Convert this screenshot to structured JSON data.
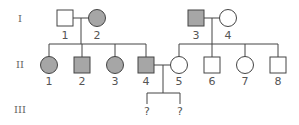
{
  "colors": {
    "affected": "#a6a6a6",
    "unaffected": "#ffffff",
    "stroke": "#444444",
    "text": "#555555"
  },
  "generations": [
    {
      "label": "I",
      "y": 22
    },
    {
      "label": "II",
      "y": 68
    },
    {
      "label": "III",
      "y": 113
    }
  ],
  "individuals": [
    {
      "id": "I-1",
      "gen": "I",
      "number": "1",
      "sex": "male",
      "affected": false,
      "cx": 65,
      "cy": 18
    },
    {
      "id": "I-2",
      "gen": "I",
      "number": "2",
      "sex": "female",
      "affected": true,
      "cx": 97,
      "cy": 18
    },
    {
      "id": "I-3",
      "gen": "I",
      "number": "3",
      "sex": "male",
      "affected": true,
      "cx": 196,
      "cy": 18
    },
    {
      "id": "I-4",
      "gen": "I",
      "number": "4",
      "sex": "female",
      "affected": false,
      "cx": 228,
      "cy": 18
    },
    {
      "id": "II-1",
      "gen": "II",
      "number": "1",
      "sex": "female",
      "affected": true,
      "cx": 49,
      "cy": 65
    },
    {
      "id": "II-2",
      "gen": "II",
      "number": "2",
      "sex": "male",
      "affected": true,
      "cx": 82,
      "cy": 65
    },
    {
      "id": "II-3",
      "gen": "II",
      "number": "3",
      "sex": "female",
      "affected": true,
      "cx": 115,
      "cy": 65
    },
    {
      "id": "II-4",
      "gen": "II",
      "number": "4",
      "sex": "male",
      "affected": true,
      "cx": 146,
      "cy": 65
    },
    {
      "id": "II-5",
      "gen": "II",
      "number": "5",
      "sex": "female",
      "affected": false,
      "cx": 179,
      "cy": 65
    },
    {
      "id": "II-6",
      "gen": "II",
      "number": "6",
      "sex": "male",
      "affected": false,
      "cx": 212,
      "cy": 65
    },
    {
      "id": "II-7",
      "gen": "II",
      "number": "7",
      "sex": "female",
      "affected": false,
      "cx": 245,
      "cy": 65
    },
    {
      "id": "II-8",
      "gen": "II",
      "number": "8",
      "sex": "male",
      "affected": false,
      "cx": 278,
      "cy": 65
    }
  ],
  "unknown_offspring": [
    {
      "id": "III-a",
      "label": "?",
      "x": 147
    },
    {
      "id": "III-b",
      "label": "?",
      "x": 180
    }
  ],
  "matings": [
    {
      "partners": [
        "I-1",
        "I-2"
      ]
    },
    {
      "partners": [
        "I-3",
        "I-4"
      ]
    },
    {
      "partners": [
        "II-4",
        "II-5"
      ]
    }
  ]
}
